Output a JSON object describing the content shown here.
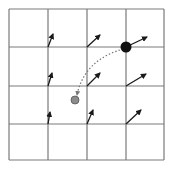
{
  "diagram": {
    "type": "vector-field-grid",
    "width": 172,
    "height": 169,
    "colors": {
      "background": "#ffffff",
      "grid_line": "#7a7a7a",
      "arrow": "#1a1a1a",
      "start_point": "#111111",
      "end_point": "#8c8c8c",
      "end_point_outline": "#555555",
      "path": "#777777"
    },
    "grid": {
      "rows": 4,
      "cols": 4,
      "x_lines": [
        9,
        48,
        87,
        126,
        164
      ],
      "y_lines": [
        9,
        47,
        86,
        124,
        160
      ]
    },
    "arrows": [
      {
        "id": "r1c1",
        "x1": 48,
        "y1": 47,
        "x2": 53,
        "y2": 34
      },
      {
        "id": "r1c2",
        "x1": 87,
        "y1": 47,
        "x2": 100,
        "y2": 35
      },
      {
        "id": "r1c3",
        "x1": 126,
        "y1": 47,
        "x2": 147,
        "y2": 37
      },
      {
        "id": "r2c1",
        "x1": 48,
        "y1": 86,
        "x2": 52,
        "y2": 73
      },
      {
        "id": "r2c2",
        "x1": 87,
        "y1": 86,
        "x2": 100,
        "y2": 73
      },
      {
        "id": "r2c3",
        "x1": 126,
        "y1": 86,
        "x2": 146,
        "y2": 74
      },
      {
        "id": "r3c1",
        "x1": 48,
        "y1": 124,
        "x2": 50,
        "y2": 112
      },
      {
        "id": "r3c2",
        "x1": 87,
        "y1": 124,
        "x2": 93,
        "y2": 110
      },
      {
        "id": "r3c3",
        "x1": 126,
        "y1": 124,
        "x2": 141,
        "y2": 110
      }
    ],
    "start_point": {
      "cx": 126,
      "cy": 47,
      "r": 5.5
    },
    "end_point": {
      "cx": 75,
      "cy": 100,
      "r": 4
    },
    "path": {
      "style": "dotted",
      "d": "M 120 50 C 100 56, 82 70, 77 95"
    }
  }
}
